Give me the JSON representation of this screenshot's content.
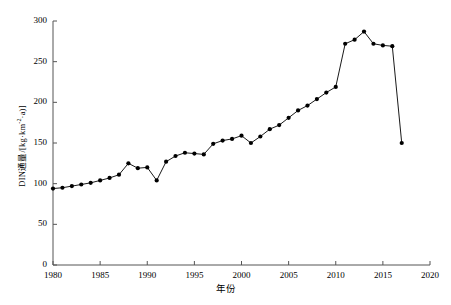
{
  "chart_data": {
    "type": "line",
    "title": "",
    "xlabel": "年份",
    "ylabel": "DIN通量/[kg·km⁻²·a)]",
    "ylabel_parts": {
      "prefix": "DIN通量/[kg·km",
      "sup1": "-2",
      "mid": "·a)]"
    },
    "xlim": [
      1980,
      2020
    ],
    "ylim": [
      0,
      300
    ],
    "xticks": [
      1980,
      1985,
      1990,
      1995,
      2000,
      2005,
      2010,
      2015,
      2020
    ],
    "yticks": [
      0,
      50,
      100,
      150,
      200,
      250,
      300
    ],
    "grid": false,
    "legend": "none",
    "marker": "filled-circle",
    "line_color": "#000000",
    "marker_color": "#000000",
    "x": [
      1980,
      1981,
      1982,
      1983,
      1984,
      1985,
      1986,
      1987,
      1988,
      1989,
      1990,
      1991,
      1992,
      1993,
      1994,
      1995,
      1996,
      1997,
      1998,
      1999,
      2000,
      2001,
      2002,
      2003,
      2004,
      2005,
      2006,
      2007,
      2008,
      2009,
      2010,
      2011,
      2012,
      2013,
      2014,
      2015,
      2016,
      2017
    ],
    "values": [
      94,
      95,
      97,
      99,
      101,
      104,
      107,
      111,
      125,
      119,
      120,
      104,
      127,
      134,
      138,
      137,
      136,
      149,
      153,
      155,
      159,
      150,
      158,
      167,
      172,
      181,
      190,
      196,
      204,
      212,
      219,
      272,
      277,
      287,
      272,
      270,
      269,
      150
    ],
    "series": [
      {
        "name": "DIN通量",
        "values": [
          94,
          95,
          97,
          99,
          101,
          104,
          107,
          111,
          125,
          119,
          120,
          104,
          127,
          134,
          138,
          137,
          136,
          149,
          153,
          155,
          159,
          150,
          158,
          167,
          172,
          181,
          190,
          196,
          204,
          212,
          219,
          272,
          277,
          287,
          272,
          270,
          269,
          150
        ]
      }
    ]
  },
  "axis": {
    "x_tick_labels": [
      "1980",
      "1985",
      "1990",
      "1995",
      "2000",
      "2005",
      "2010",
      "2015",
      "2020"
    ],
    "y_tick_labels": [
      "0",
      "50",
      "100",
      "150",
      "200",
      "250",
      "300"
    ]
  }
}
